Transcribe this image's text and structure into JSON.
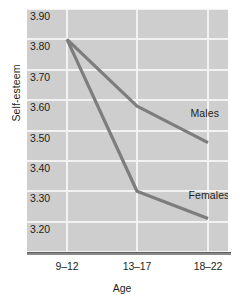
{
  "chart_data": {
    "type": "line",
    "title": "",
    "xlabel": "Age",
    "ylabel": "Self-esteem",
    "categories": [
      "9–12",
      "13–17",
      "18–22"
    ],
    "ylim": [
      3.1,
      3.9
    ],
    "yticks": [
      "3.90",
      "3.80",
      "3.70",
      "3.60",
      "3.50",
      "3.40",
      "3.30",
      "3.20",
      "3.10"
    ],
    "ytick_values": [
      3.9,
      3.8,
      3.7,
      3.6,
      3.5,
      3.4,
      3.3,
      3.2,
      3.1
    ],
    "grid": true,
    "legend_position": "inline-annotations",
    "series": [
      {
        "name": "Males",
        "values": [
          3.8,
          3.58,
          3.46
        ]
      },
      {
        "name": "Females",
        "values": [
          3.8,
          3.3,
          3.21
        ]
      }
    ],
    "annotations": [
      {
        "text": "Males",
        "series": "Males"
      },
      {
        "text": "Females",
        "series": "Females"
      }
    ],
    "colors": {
      "plot_background": "#cecece",
      "gridline": "#f2f2f2",
      "series_line": "#7d7d7d",
      "axis_line": "#8a8a8a",
      "text": "#231f20",
      "page_background": "#ffffff"
    }
  }
}
